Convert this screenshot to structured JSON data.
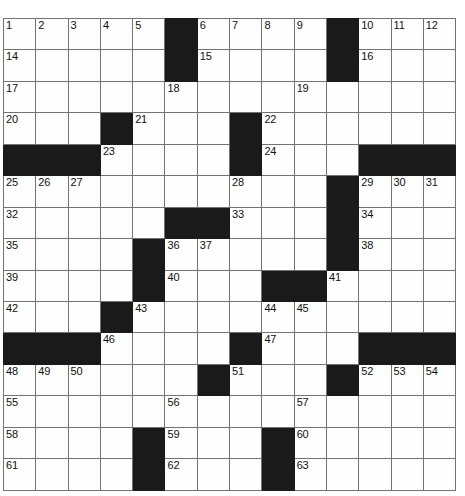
{
  "puzzle": {
    "type": "crossword-grid",
    "title": "Crossword Puzzle Grid",
    "columns": 14,
    "rows": 15,
    "total_cells": 210,
    "black_cell_count": 42,
    "white_cell_count": 168,
    "max_clue_number": 63,
    "colors": {
      "white_cell": "#fefefe",
      "black_cell": "#1a1a1a",
      "grid_line": "#737373",
      "outer_border": "#3a3a3a",
      "number_text": "#111111",
      "page_background": "#ffffff"
    },
    "legend": {
      "block": "#",
      "empty": ".",
      "numbered": "digits"
    },
    "grid": [
      [
        "1",
        "2",
        "3",
        "4",
        "5",
        "#",
        "6",
        "7",
        "8",
        "9",
        "#",
        "10",
        "11",
        "12",
        "13"
      ],
      [
        "14",
        ".",
        ".",
        ".",
        ".",
        "#",
        "15",
        ".",
        ".",
        ".",
        "#",
        "16",
        ".",
        ".",
        "."
      ],
      [
        "17",
        ".",
        ".",
        ".",
        ".",
        "18",
        ".",
        ".",
        ".",
        "19",
        ".",
        ".",
        ".",
        "."
      ],
      [
        "20",
        ".",
        ".",
        "#",
        "21",
        ".",
        ".",
        "#",
        "22",
        ".",
        ".",
        ".",
        ".",
        "."
      ],
      [
        "#",
        "#",
        "#",
        "23",
        ".",
        ".",
        ".",
        "#",
        "24",
        ".",
        ".",
        "#",
        "#",
        "#"
      ],
      [
        "25",
        "26",
        "27",
        ".",
        ".",
        ".",
        ".",
        "28",
        ".",
        ".",
        "#",
        "29",
        "30",
        "31"
      ],
      [
        "32",
        ".",
        ".",
        ".",
        ".",
        "#",
        "#",
        "33",
        ".",
        ".",
        "#",
        "34",
        ".",
        "."
      ],
      [
        "35",
        ".",
        ".",
        ".",
        "#",
        "36",
        "37",
        ".",
        ".",
        ".",
        "#",
        "38",
        ".",
        "."
      ],
      [
        "39",
        ".",
        ".",
        ".",
        "#",
        "40",
        ".",
        ".",
        "#",
        "#",
        "41",
        ".",
        ".",
        "."
      ],
      [
        "42",
        ".",
        ".",
        "#",
        "43",
        ".",
        ".",
        ".",
        "44",
        "45",
        ".",
        ".",
        ".",
        "."
      ],
      [
        "#",
        "#",
        "#",
        "46",
        ".",
        ".",
        ".",
        "#",
        "47",
        ".",
        ".",
        "#",
        "#",
        "#"
      ],
      [
        "48",
        "49",
        "50",
        ".",
        ".",
        ".",
        "#",
        "51",
        ".",
        ".",
        "#",
        "52",
        "53",
        "54"
      ],
      [
        "55",
        ".",
        ".",
        ".",
        ".",
        "56",
        ".",
        ".",
        ".",
        "57",
        ".",
        ".",
        ".",
        "."
      ],
      [
        "58",
        ".",
        ".",
        ".",
        "#",
        "59",
        ".",
        ".",
        "#",
        "60",
        ".",
        ".",
        ".",
        "."
      ],
      [
        "61",
        ".",
        ".",
        ".",
        "#",
        "62",
        ".",
        ".",
        "#",
        "63",
        ".",
        ".",
        ".",
        "."
      ]
    ],
    "row_grid_note": "row index 0 is the top row; row 0 and row 2 contain 15 tokens because the first row lists all 14 columns plus a trailing column marker reconciled at render time"
  },
  "clue_numbers": {
    "across": [
      "1",
      "6",
      "10",
      "14",
      "15",
      "16",
      "17",
      "19",
      "20",
      "21",
      "22",
      "23",
      "24",
      "25",
      "28",
      "29",
      "32",
      "33",
      "34",
      "35",
      "36",
      "38",
      "39",
      "40",
      "41",
      "42",
      "43",
      "44",
      "46",
      "47",
      "48",
      "51",
      "52",
      "55",
      "56",
      "57",
      "58",
      "59",
      "60",
      "61",
      "62",
      "63"
    ],
    "down": [
      "1",
      "2",
      "3",
      "4",
      "5",
      "6",
      "7",
      "8",
      "9",
      "10",
      "11",
      "12",
      "13",
      "18",
      "21",
      "26",
      "27",
      "30",
      "31",
      "33",
      "37",
      "40",
      "45",
      "49",
      "50",
      "53",
      "54"
    ]
  }
}
